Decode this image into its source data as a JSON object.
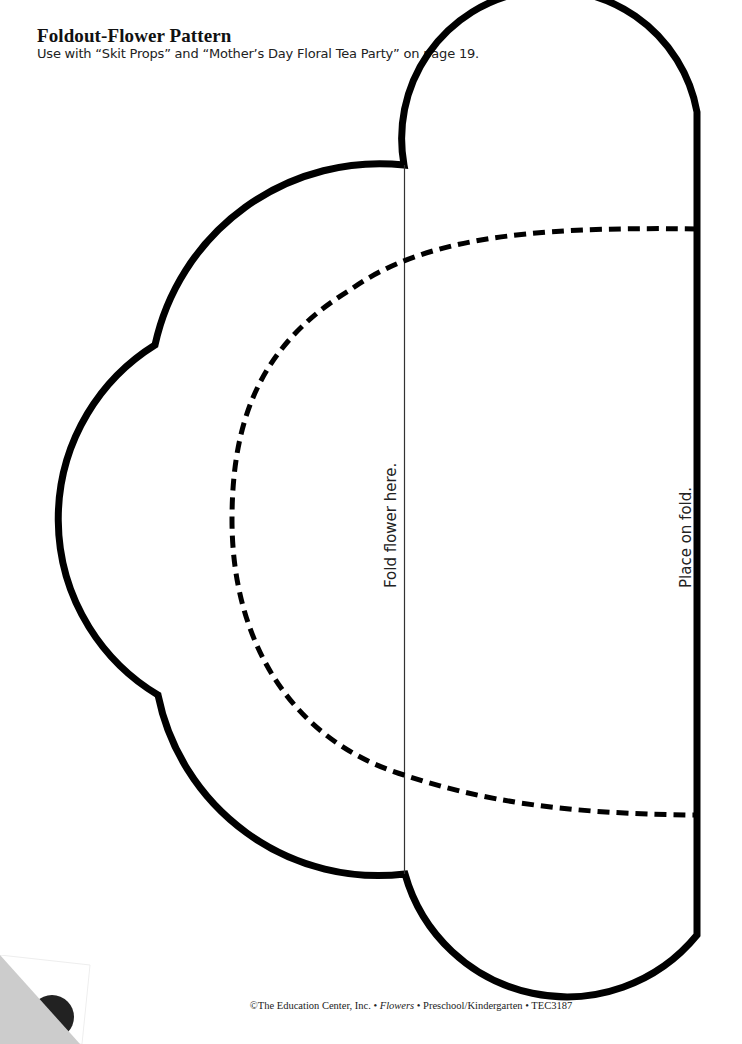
{
  "header": {
    "title": "Foldout-Flower Pattern",
    "subtitle": "Use with “Skit Props” and “Mother’s Day Floral Tea Party” on page 19."
  },
  "pattern": {
    "fold_label": "Fold flower here.",
    "place_label": "Place on fold.",
    "outline_color": "#000000",
    "fold_line_color": "#333333",
    "dashed_line_color": "#000000"
  },
  "footer": {
    "copyright": "©The Education Center, Inc. • ",
    "book_title": "Flowers",
    "rest": " • Preschool/Kindergarten • TEC3187"
  },
  "decor": {
    "page_curl_color": "#cccccc",
    "page_number_circle_color": "#222222"
  }
}
